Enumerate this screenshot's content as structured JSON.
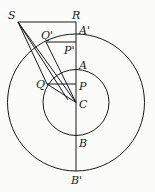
{
  "diagram": {
    "type": "geometry",
    "colors": {
      "stroke": "#1a1a1a",
      "background": "#fbfbfa"
    },
    "labels": {
      "S": "S",
      "R": "R",
      "A_prime": "A'",
      "Q_prime": "Q'",
      "P_prime": "P'",
      "A": "A",
      "Q": "Q",
      "P": "P",
      "C": "C",
      "B": "B",
      "B_prime": "B'"
    }
  }
}
